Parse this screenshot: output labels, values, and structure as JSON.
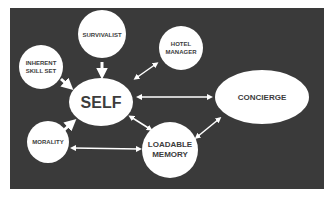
{
  "diagram": {
    "background_color": "#3a3a3a",
    "node_color": "#ffffff",
    "text_color": "#3c3c3c",
    "arrow_color": "#ffffff",
    "nodes": {
      "survivalist": {
        "label": "SURVIVALIST"
      },
      "hotel_manager": {
        "line1": "HOTEL",
        "line2": "MANAGER"
      },
      "inherent_skill_set": {
        "line1": "INHERENT",
        "line2": "SKILL SET"
      },
      "self": {
        "label": "SELF"
      },
      "concierge": {
        "label": "CONCIERGE"
      },
      "morality": {
        "label": "MORALITY"
      },
      "loadable_memory": {
        "line1": "LOADABLE",
        "line2": "MEMORY"
      }
    },
    "edges": [
      {
        "from": "survivalist",
        "to": "self",
        "direction": "one-way"
      },
      {
        "from": "inherent_skill_set",
        "to": "self",
        "direction": "one-way"
      },
      {
        "from": "morality",
        "to": "self",
        "direction": "one-way"
      },
      {
        "from": "hotel_manager",
        "to": "self",
        "direction": "two-way"
      },
      {
        "from": "self",
        "to": "concierge",
        "direction": "two-way"
      },
      {
        "from": "self",
        "to": "loadable_memory",
        "direction": "two-way"
      },
      {
        "from": "morality",
        "to": "loadable_memory",
        "direction": "two-way"
      },
      {
        "from": "loadable_memory",
        "to": "concierge",
        "direction": "two-way"
      }
    ]
  }
}
